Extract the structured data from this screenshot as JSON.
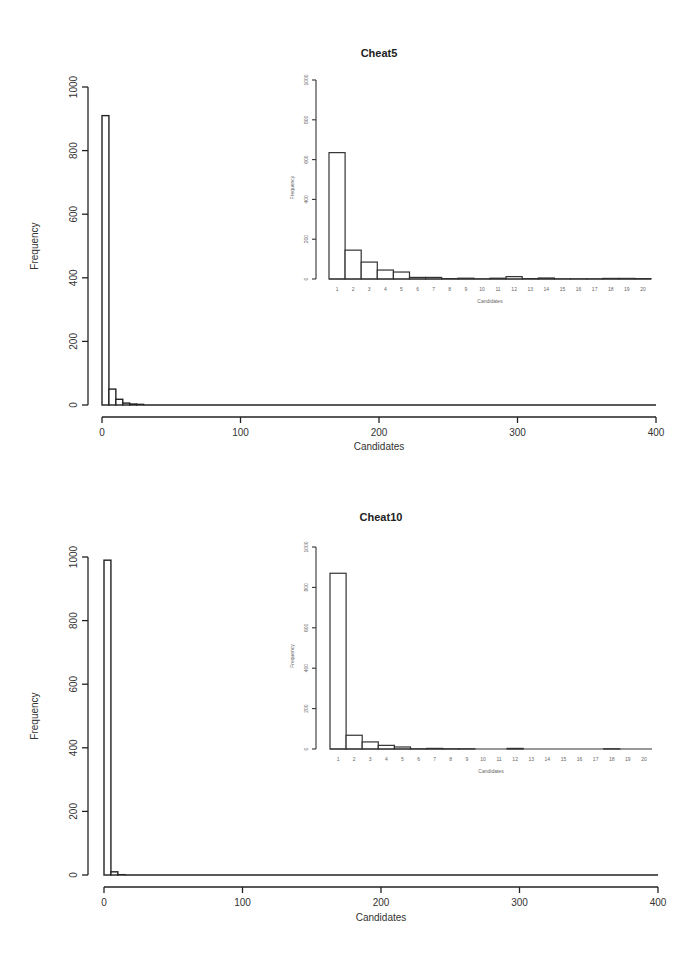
{
  "chart_data": [
    {
      "type": "bar",
      "title": "Cheat5",
      "xlabel": "Candidates",
      "ylabel": "Frequency",
      "xlim": [
        0,
        400
      ],
      "ylim": [
        0,
        1000
      ],
      "xticks": [
        "0",
        "100",
        "200",
        "300",
        "400"
      ],
      "yticks": [
        "0",
        "200",
        "400",
        "600",
        "800",
        "1000"
      ],
      "bin_width": 5,
      "bins": [
        0,
        5,
        10,
        15,
        20,
        25
      ],
      "values": [
        910,
        50,
        18,
        6,
        3,
        2
      ],
      "grid": false,
      "inset": {
        "type": "bar",
        "xlabel": "Candidates",
        "ylabel": "Frequency",
        "ylim": [
          0,
          1000
        ],
        "yticks": [
          "0",
          "200",
          "400",
          "600",
          "800",
          "1000"
        ],
        "categories": [
          "1",
          "2",
          "3",
          "4",
          "5",
          "6",
          "7",
          "8",
          "9",
          "10",
          "11",
          "12",
          "13",
          "14",
          "15",
          "16",
          "17",
          "18",
          "19",
          "20"
        ],
        "values": [
          635,
          145,
          85,
          45,
          35,
          8,
          8,
          2,
          4,
          1,
          4,
          12,
          2,
          5,
          1,
          1,
          1,
          3,
          3,
          2
        ]
      }
    },
    {
      "type": "bar",
      "title": "Cheat10",
      "xlabel": "Candidates",
      "ylabel": "Frequency",
      "xlim": [
        0,
        400
      ],
      "ylim": [
        0,
        1000
      ],
      "xticks": [
        "0",
        "100",
        "200",
        "300",
        "400"
      ],
      "yticks": [
        "0",
        "200",
        "400",
        "600",
        "800",
        "1000"
      ],
      "bin_width": 5,
      "bins": [
        0,
        5,
        10
      ],
      "values": [
        990,
        10,
        1
      ],
      "grid": false,
      "inset": {
        "type": "bar",
        "xlabel": "Candidates",
        "ylabel": "Frequency",
        "ylim": [
          0,
          1000
        ],
        "yticks": [
          "0",
          "200",
          "400",
          "600",
          "800",
          "1000"
        ],
        "categories": [
          "1",
          "2",
          "3",
          "4",
          "5",
          "6",
          "7",
          "8",
          "9",
          "10",
          "11",
          "12",
          "13",
          "14",
          "15",
          "16",
          "17",
          "18",
          "19",
          "20"
        ],
        "values": [
          870,
          68,
          35,
          18,
          10,
          1,
          3,
          1,
          1,
          0,
          0,
          3,
          0,
          0,
          0,
          0,
          0,
          1,
          0,
          0
        ]
      }
    }
  ]
}
